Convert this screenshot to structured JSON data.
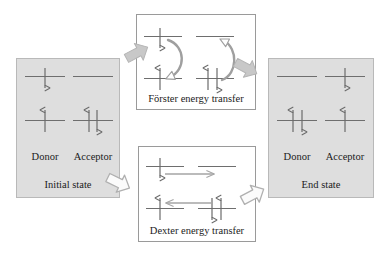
{
  "figure": {
    "colors": {
      "panel_shaded_fill": "#dedede",
      "panel_shaded_border": "#b9b9b9",
      "panel_white_fill": "#ffffff",
      "panel_white_border": "#9a9a9a",
      "energy_level_line": "#6e6e6e",
      "spin_arrow": "#6b6b6b",
      "curved_transfer_arrow": "#9f9f9f",
      "straight_transfer_arrow": "#a5a5a5",
      "block_arrow_filled": "#c8c8c8",
      "block_arrow_outline_fill": "#fbfbfb",
      "block_arrow_stroke": "#b0b0b0",
      "text": "#1b1b1b"
    }
  },
  "panels": {
    "initial": {
      "state_label": "Initial state",
      "donor_label": "Donor",
      "acceptor_label": "Acceptor",
      "donor": {
        "excited_electrons": [
          "down"
        ],
        "ground_electrons": [
          "up"
        ]
      },
      "acceptor": {
        "excited_electrons": [],
        "ground_electrons": [
          "up",
          "down"
        ]
      }
    },
    "forster": {
      "process_label": "Förster energy transfer",
      "donor": {
        "excited_electrons": [
          "down"
        ],
        "ground_electrons": [
          "up"
        ],
        "transfer_arrow": "curved-down"
      },
      "acceptor": {
        "excited_electrons": [],
        "ground_electrons": [
          "up",
          "down"
        ],
        "transfer_arrow": "curved-up"
      }
    },
    "dexter": {
      "process_label": "Dexter energy transfer",
      "donor": {
        "excited_electrons": [
          "down"
        ],
        "ground_electrons": [
          "up"
        ]
      },
      "acceptor": {
        "excited_electrons": [],
        "ground_electrons": [
          "down",
          "up"
        ]
      },
      "transfer_arrows": [
        {
          "level": "excited",
          "direction": "right"
        },
        {
          "level": "ground",
          "direction": "left"
        }
      ]
    },
    "end": {
      "state_label": "End state",
      "donor_label": "Donor",
      "acceptor_label": "Acceptor",
      "donor": {
        "excited_electrons": [],
        "ground_electrons": [
          "up",
          "down"
        ]
      },
      "acceptor": {
        "excited_electrons": [
          "down"
        ],
        "ground_electrons": [
          "up"
        ]
      }
    }
  },
  "connectors": [
    {
      "name": "initial-to-forster",
      "style": "filled",
      "direction": "up-right"
    },
    {
      "name": "forster-to-end",
      "style": "filled",
      "direction": "down-right"
    },
    {
      "name": "initial-to-dexter",
      "style": "outlined",
      "direction": "down-right"
    },
    {
      "name": "dexter-to-end",
      "style": "outlined",
      "direction": "up-right"
    }
  ]
}
